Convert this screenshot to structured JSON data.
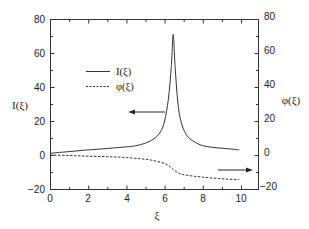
{
  "chart_data": {
    "type": "line",
    "title": "",
    "xlabel": "ξ",
    "ylabel_left": "I(ξ)",
    "ylabel_right": "φ(ξ)",
    "xlim": [
      0,
      11
    ],
    "ylim_left": [
      -20,
      80
    ],
    "ylim_right": [
      -20,
      80
    ],
    "x_ticks": [
      0,
      2,
      4,
      6,
      8,
      10
    ],
    "y_ticks_left": [
      -20,
      0,
      20,
      40,
      60,
      80
    ],
    "y_ticks_right": [
      -20,
      0,
      20,
      40,
      60,
      80
    ],
    "grid": false,
    "legend_position": "upper-left-center",
    "series": [
      {
        "name": "I(ξ)",
        "style": "solid",
        "axis": "left",
        "x": [
          0,
          0.5,
          1,
          2,
          3,
          4,
          4.5,
          5,
          5.5,
          5.8,
          6.0,
          6.2,
          6.35,
          6.45,
          6.55,
          6.7,
          6.9,
          7.2,
          7.6,
          8.0,
          8.5,
          9.0,
          9.5,
          9.9
        ],
        "values": [
          1,
          1.5,
          2,
          3,
          3.8,
          4.8,
          5.5,
          7,
          10,
          14,
          20,
          33,
          52,
          71,
          52,
          30,
          18,
          11,
          7.5,
          5.5,
          4.5,
          4,
          3.5,
          3
        ]
      },
      {
        "name": "φ(ξ)",
        "style": "dashed",
        "axis": "right",
        "x": [
          0,
          1,
          2,
          3,
          4,
          5,
          5.5,
          6.0,
          6.3,
          6.5,
          6.8,
          7.2,
          8,
          9,
          9.9
        ],
        "values": [
          0,
          -0.3,
          -0.7,
          -1,
          -1.5,
          -2.5,
          -3.5,
          -5,
          -7,
          -9,
          -11,
          -12,
          -13,
          -14,
          -14.5
        ]
      }
    ],
    "annotations": [
      {
        "type": "arrow",
        "direction": "left",
        "meaning": "I(ξ) uses left axis",
        "y_approx": 25
      },
      {
        "type": "arrow",
        "direction": "right",
        "meaning": "φ(ξ) uses right axis",
        "y_approx": -9
      }
    ]
  },
  "legend": {
    "items": [
      {
        "label": "I(ξ)",
        "style": "solid"
      },
      {
        "label": "φ(ξ)",
        "style": "dashed"
      }
    ]
  },
  "axes": {
    "xlabel": "ξ",
    "ylabel_left": "I(ξ)",
    "ylabel_right": "φ(ξ)",
    "x_tick_labels": [
      "0",
      "2",
      "4",
      "6",
      "8",
      "10"
    ],
    "y_tick_labels_left": [
      "80",
      "60",
      "40",
      "20",
      "0",
      "−20"
    ],
    "y_tick_labels_right": [
      "80",
      "60",
      "40",
      "20",
      "0",
      "−20"
    ]
  },
  "colors": {
    "line": "#333333",
    "axis": "#333333",
    "text": "#222222",
    "background": "#ffffff"
  }
}
